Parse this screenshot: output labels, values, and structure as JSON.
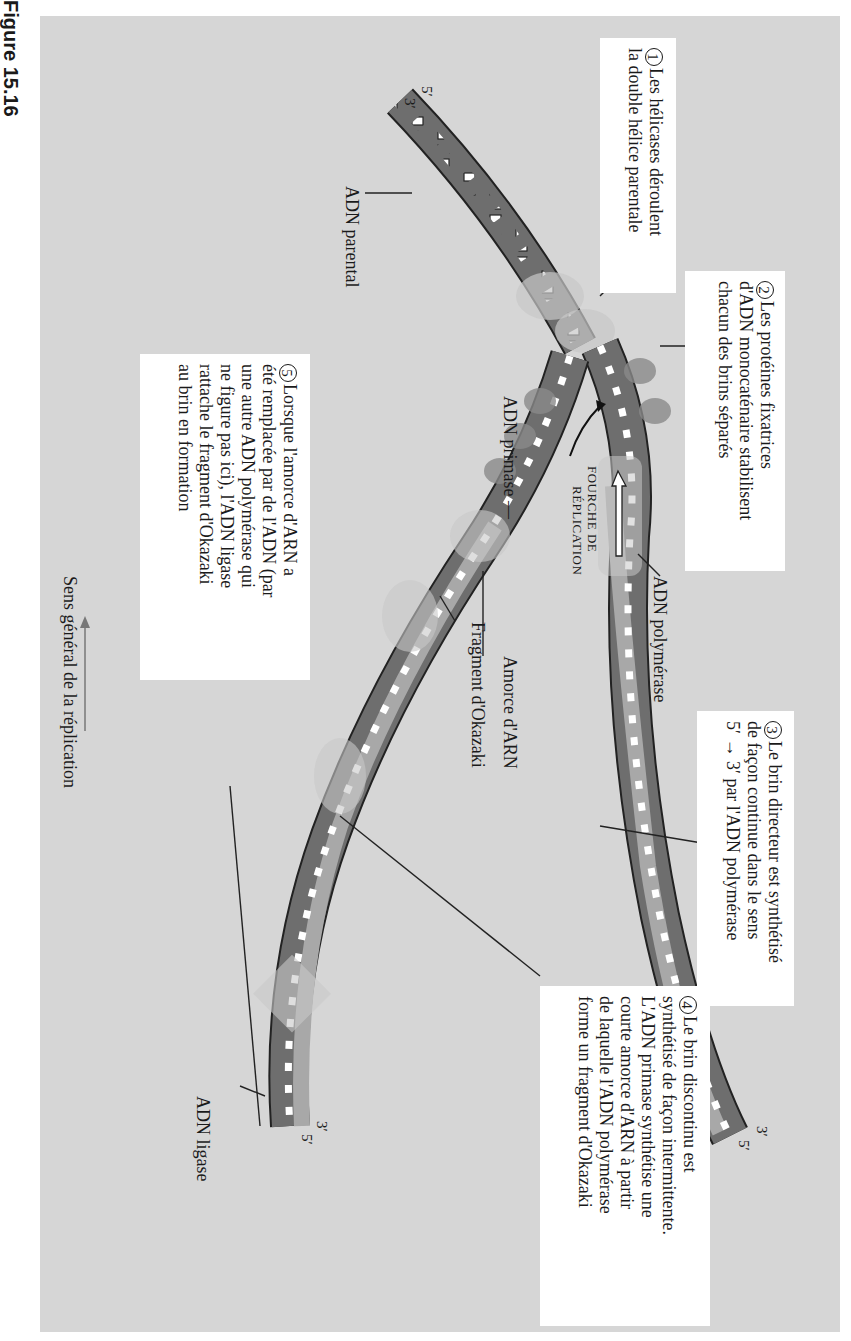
{
  "figure": {
    "label": "Figure 15.16"
  },
  "steps": [
    {
      "number": "1",
      "lines": [
        "Les hélicases déroulent",
        "la double hélice parentale"
      ]
    },
    {
      "number": "2",
      "lines": [
        "Les protéines fixatrices",
        "d'ADN monocaténaire stabilisent",
        "chacun des brins séparés"
      ]
    },
    {
      "number": "3",
      "lines": [
        "Le brin directeur est synthétisé",
        "de façon continue dans le sens",
        "5′ → 3′ par l'ADN polymérase"
      ]
    },
    {
      "number": "4",
      "lines": [
        "Le brin discontinu est",
        "synthétisé de façon intermittente.",
        "L'ADN primase synthétise une",
        "courte amorce d'ARN à partir",
        "de laquelle l'ADN polymérase",
        "forme un fragment d'Okazaki"
      ]
    },
    {
      "number": "5",
      "lines": [
        "Lorsque l'amorce d'ARN a",
        "été remplacée par de l'ADN (par",
        "une autre ADN polymérase qui",
        "ne figure pas ici), l'ADN ligase",
        "rattache le fragment d'Okazaki",
        "au brin en formation"
      ]
    }
  ],
  "labels": {
    "parental_dna": "ADN parental",
    "dna_polymerase": "ADN polymérase",
    "primase": "ADN primase —",
    "fork_line1": "FOURCHE DE",
    "fork_line2": "RÉPLICATION",
    "rna_primer": "Amorce d'ARN",
    "okazaki": "Fragment d'Okazaki",
    "ligase": "ADN ligase",
    "direction": "Sens général de la réplication"
  },
  "ends": {
    "top_5": "5′",
    "top_3": "3′",
    "leading_3": "3′",
    "leading_5": "5′",
    "lagging_3": "3′",
    "lagging_5": "5′"
  },
  "colors": {
    "background": "#d6d6d6",
    "parental_strand": "#6e6e6e",
    "new_strand": "#a8a8a8",
    "protein": "#bdbdbd",
    "box": "#ffffff"
  }
}
